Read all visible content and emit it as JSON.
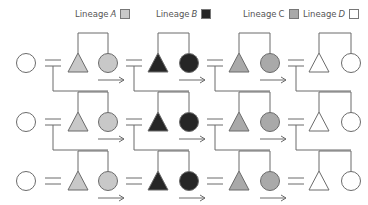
{
  "legend": [
    {
      "prefix": "Lineage ",
      "letter": "A",
      "italic": true,
      "color": "#c8c8c8"
    },
    {
      "prefix": "Lineage ",
      "letter": "B",
      "italic": true,
      "color": "#262626"
    },
    {
      "prefix": "Lineage ",
      "letter": "C",
      "italic": false,
      "color": "#a9a9a9"
    },
    {
      "prefix": "Lineage ",
      "letter": "D",
      "italic": true,
      "color": "#ffffff"
    }
  ],
  "diagram": {
    "type": "kinship-diagram",
    "rows": 3,
    "lineages": [
      "A",
      "B",
      "C",
      "D"
    ],
    "fills": {
      "A": "#c8c8c8",
      "B": "#262626",
      "C": "#a9a9a9",
      "D": "#ffffff",
      "outsider": "#ffffff"
    },
    "stroke": "#6b6b6b"
  }
}
